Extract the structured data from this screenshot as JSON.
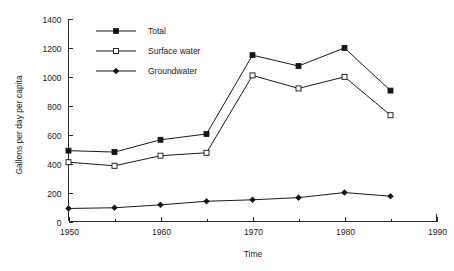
{
  "chart_data": {
    "type": "line",
    "title": "",
    "xlabel": "Time",
    "ylabel": "Gallons per day per capita",
    "xlim": [
      1950,
      1990
    ],
    "ylim": [
      0,
      1400
    ],
    "grid": false,
    "legend_position": "top-left-inside",
    "x": [
      1950,
      1955,
      1960,
      1965,
      1970,
      1975,
      1980,
      1985
    ],
    "xtick_labels": [
      "1950",
      "1960",
      "1970",
      "1980",
      "1990"
    ],
    "xticks": [
      1950,
      1960,
      1970,
      1980,
      1990
    ],
    "xticks_minor": [
      1955,
      1965,
      1975,
      1985
    ],
    "ytick_labels": [
      "0",
      "200",
      "400",
      "600",
      "800",
      "1000",
      "1200",
      "1400"
    ],
    "yticks": [
      0,
      200,
      400,
      600,
      800,
      1000,
      1200,
      1400
    ],
    "series": [
      {
        "name": "Total",
        "marker": "filled-square",
        "values": [
          490,
          480,
          565,
          605,
          1150,
          1075,
          1200,
          905
        ]
      },
      {
        "name": "Surface water",
        "marker": "open-square",
        "values": [
          410,
          385,
          455,
          475,
          1010,
          920,
          1000,
          735
        ]
      },
      {
        "name": "Groundwater",
        "marker": "filled-diamond",
        "values": [
          90,
          95,
          115,
          140,
          150,
          165,
          200,
          175
        ]
      }
    ]
  },
  "legend": {
    "entries": [
      {
        "label": "Total"
      },
      {
        "label": "Surface water"
      },
      {
        "label": "Groundwater"
      }
    ]
  },
  "colors": {
    "line": "#1a1a1a",
    "axis": "#2b2b2b",
    "background": "#ffffff",
    "marker_fill": "#141414",
    "marker_open_fill": "#ffffff"
  }
}
